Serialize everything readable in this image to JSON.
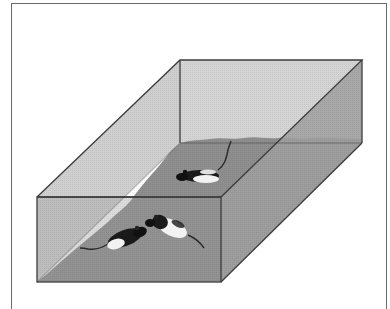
{
  "figure": {
    "colors": {
      "background": "#ffffff",
      "frame": "#6a6a6a",
      "glass_light": "#d2d2d2",
      "glass_side": "#a9a9a9",
      "bedding": "#8e8e8e",
      "bedding_front": "#888888",
      "edge": "#3c3c3c",
      "rat_dark": "#1a1a1a",
      "rat_light": "#f2f2f2"
    },
    "box": {
      "back_top_left": [
        180,
        60
      ],
      "back_top_right": [
        362,
        60
      ],
      "front_top_left": [
        37,
        197
      ],
      "front_top_right": [
        221,
        197
      ],
      "front_bottom_left": [
        37,
        282
      ],
      "front_bottom_right": [
        221,
        282
      ],
      "back_bottom_right": [
        362,
        143
      ]
    },
    "animals": [
      {
        "label": "rat-back",
        "position": [
          200,
          177
        ],
        "facing": "left"
      },
      {
        "label": "rat-front-left",
        "position": [
          120,
          238
        ],
        "facing": "right"
      },
      {
        "label": "rat-front-right",
        "position": [
          170,
          225
        ],
        "facing": "left"
      }
    ]
  }
}
